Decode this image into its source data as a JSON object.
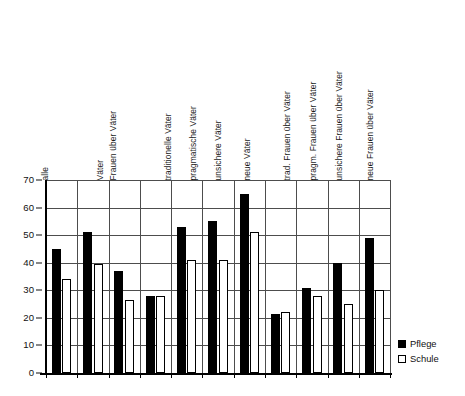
{
  "chart_data": {
    "type": "bar",
    "title": "",
    "subtitle": "",
    "xlabel": "",
    "ylabel": "",
    "ylim": [
      0,
      70
    ],
    "yticks": [
      0,
      10,
      20,
      30,
      40,
      50,
      60,
      70
    ],
    "grid": true,
    "legend_position": "bottom-right",
    "categories": [
      "alle",
      "Väter",
      "Frauen über Väter",
      "traditionelle Väter",
      "pragmatische Väter",
      "unsichere Väter",
      "neue Väter",
      "trad. Frauen über Väter",
      "pragm. Frauen über Väter",
      "unsichere Frauen über Väter",
      "neue Frauen über Väter"
    ],
    "series": [
      {
        "name": "Pflege",
        "color": "#000000",
        "values": [
          45,
          51,
          37,
          28,
          53,
          55,
          65,
          21.5,
          31,
          40,
          49
        ]
      },
      {
        "name": "Schule",
        "color": "#ffffff",
        "values": [
          34,
          39.5,
          26.5,
          28,
          41,
          41,
          51,
          22,
          28,
          25,
          30
        ]
      }
    ]
  },
  "legend": {
    "items": [
      {
        "label": "Pflege",
        "style": "filled"
      },
      {
        "label": "Schule",
        "style": "outline"
      }
    ]
  }
}
